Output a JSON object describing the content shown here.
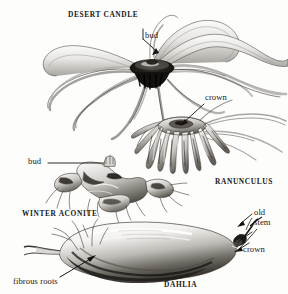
{
  "plate": {
    "title": "Tuberous and fleshy root types",
    "medium": "engraved botanical illustration",
    "background_color": "#fdfdfc",
    "ink_color": "#1a1714"
  },
  "specimens": [
    {
      "id": "desert-candle",
      "name": "DESERT CANDLE",
      "description": "spreading fleshy starfish-like root with dark central crown and long radiating tapering roots"
    },
    {
      "id": "ranunculus",
      "name": "RANUNCULUS",
      "description": "claw-shaped cluster of narrow downward-pointing tubers joined at a crown"
    },
    {
      "id": "winter-aconite",
      "name": "WINTER ACONITE",
      "description": "knobbly irregular tuber with small fibrous rootlets and a bud at the top"
    },
    {
      "id": "dahlia",
      "name": "DAHLIA",
      "description": "large elongated swollen tuber shaded dark beneath, tapering to fibrous roots at left and an old stem with crown at right"
    }
  ],
  "labels": {
    "desert_candle": "DESERT CANDLE",
    "bud_top": "bud",
    "crown_top": "crown",
    "ranunculus": "RANUNCULUS",
    "bud_left": "bud",
    "winter_aconite": "WINTER ACONITE",
    "old_stem_line1": "old",
    "old_stem_line2": "stem",
    "crown_bottom": "crown",
    "fibrous_roots": "fibrous roots",
    "dahlia": "DAHLIA"
  },
  "leader_lines": [
    {
      "name": "bud-top-leader",
      "from": "bud label",
      "to": "desert candle crown"
    },
    {
      "name": "crown-top-leader",
      "from": "crown label",
      "to": "ranunculus crown"
    },
    {
      "name": "bud-left-leader",
      "from": "bud label",
      "to": "winter aconite bud"
    },
    {
      "name": "old-stem-leader",
      "from": "old stem label",
      "to": "dahlia stem remnant"
    },
    {
      "name": "crown-bottom-leader",
      "from": "crown label",
      "to": "dahlia crown"
    },
    {
      "name": "fibrous-roots-leader",
      "from": "fibrous roots label",
      "to": "dahlia root fibres"
    }
  ]
}
